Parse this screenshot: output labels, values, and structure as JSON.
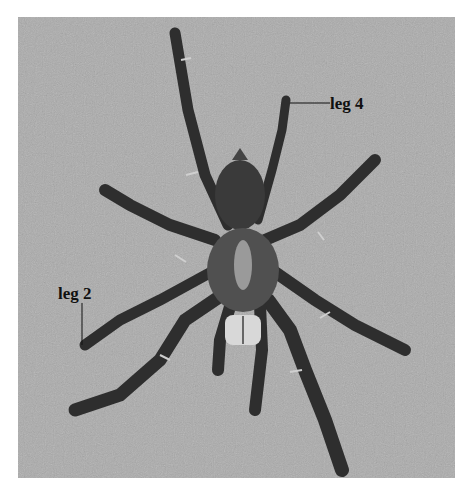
{
  "figure": {
    "background_color": "#a9a9a9",
    "labels": [
      {
        "id": "leg4",
        "text": "leg 4",
        "x": 330,
        "y": 94
      },
      {
        "id": "leg2",
        "text": "leg 2",
        "x": 58,
        "y": 285
      }
    ]
  }
}
